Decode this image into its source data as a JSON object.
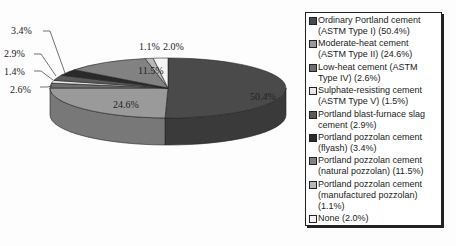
{
  "chart_data": {
    "type": "pie",
    "style": "3d-exploded-none",
    "title": "",
    "legend_position": "right",
    "slices": [
      {
        "label": "Ordinary Portland cement (ASTM Type I) (50.4%)",
        "value": 50.4,
        "data_label": "50.4%",
        "color": "#4a4a4a"
      },
      {
        "label": "Moderate-heat cement (ASTM Type II) (24.6%)",
        "value": 24.6,
        "data_label": "24.6%",
        "color": "#9a9a9a"
      },
      {
        "label": "Low-heat cement (ASTM Type IV) (2.6%)",
        "value": 2.6,
        "data_label": "2.6%",
        "color": "#6e6e6e"
      },
      {
        "label": "Sulphate-resisting cement (ASTM Type V) (1.5%)",
        "value": 1.5,
        "data_label": "1.4%",
        "color": "#e8e8e8"
      },
      {
        "label": "Portland blast-furnace slag cement (2.9%)",
        "value": 2.9,
        "data_label": "2.9%",
        "color": "#5a5a5a"
      },
      {
        "label": "Portland pozzolan cement (flyash) (3.4%)",
        "value": 3.4,
        "data_label": "3.4%",
        "color": "#2a2a2a"
      },
      {
        "label": "Portland pozzolan cement (natural pozzolan) (11.5%)",
        "value": 11.5,
        "data_label": "11.5%",
        "color": "#828282"
      },
      {
        "label": "Portland pozzolan cement (manufactured pozzolan) (1.1%)",
        "value": 1.1,
        "data_label": "1.1%",
        "color": "#b8b8b8"
      },
      {
        "label": "None (2.0%)",
        "value": 2.0,
        "data_label": "2.0%",
        "color": "#f4f4f4"
      }
    ]
  },
  "legend": {
    "items": [
      {
        "label": "Ordinary Portland cement (ASTM Type I) (50.4%)",
        "color": "#4a4a4a"
      },
      {
        "label": "Moderate-heat cement (ASTM Type II) (24.6%)",
        "color": "#9a9a9a"
      },
      {
        "label": "Low-heat cement (ASTM Type IV) (2.6%)",
        "color": "#6e6e6e"
      },
      {
        "label": "Sulphate-resisting cement (ASTM Type V) (1.5%)",
        "color": "#e8e8e8"
      },
      {
        "label": "Portland blast-furnace slag cement (2.9%)",
        "color": "#5a5a5a"
      },
      {
        "label": "Portland pozzolan cement (flyash) (3.4%)",
        "color": "#2a2a2a"
      },
      {
        "label": "Portland pozzolan cement (natural pozzolan) (11.5%)",
        "color": "#828282"
      },
      {
        "label": "Portland pozzolan cement (manufactured pozzolan) (1.1%)",
        "color": "#b8b8b8"
      },
      {
        "label": "None (2.0%)",
        "color": "#f4f4f4"
      }
    ]
  }
}
